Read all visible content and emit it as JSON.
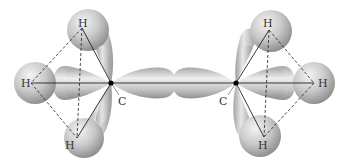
{
  "diagram": {
    "labels": {
      "left_carbon": "C",
      "right_carbon": "C",
      "h_left_top": "H",
      "h_left_left": "H",
      "h_left_bottom": "H",
      "h_right_top": "H",
      "h_right_right": "H",
      "h_right_bottom": "H"
    },
    "colors": {
      "background": "#ffffff",
      "orbital_light": "#f2f2f2",
      "orbital_mid": "#c4c4c4",
      "orbital_dark": "#8c8c8c",
      "bond_line": "#222222",
      "nucleus": "#000000",
      "label": "#333333"
    }
  }
}
